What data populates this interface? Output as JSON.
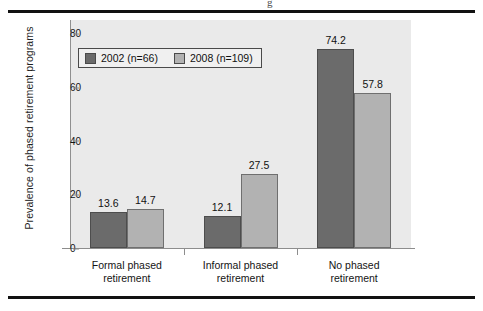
{
  "page": {
    "cut_glyph": "g"
  },
  "chart_data": {
    "type": "bar",
    "title": "",
    "xlabel": "",
    "ylabel": "Prevalence of phased retirement programs",
    "ylim": [
      0,
      85
    ],
    "yticks": [
      "0",
      "20",
      "40",
      "60",
      "80"
    ],
    "grid": false,
    "legend_position": "top-left",
    "categories": [
      "Formal phased\nretirement",
      "Informal phased\nretirement",
      "No phased\nretirement"
    ],
    "category_lines": [
      [
        "Formal phased",
        "retirement"
      ],
      [
        "Informal phased",
        "retirement"
      ],
      [
        "No phased",
        "retirement"
      ]
    ],
    "series": [
      {
        "name": "2002 (n=66)",
        "color": "#6b6b6b",
        "values": [
          13.6,
          14.7,
          0
        ],
        "value_labels": [
          "13.6",
          "12.1",
          "74.2"
        ],
        "data": [
          13.6,
          12.1,
          74.2
        ]
      },
      {
        "name": "2008 (n=109)",
        "color": "#b2b2b2",
        "values": [
          14.7,
          27.5,
          57.8
        ],
        "value_labels": [
          "14.7",
          "27.5",
          "57.8"
        ],
        "data": [
          14.7,
          27.5,
          57.8
        ]
      }
    ]
  },
  "legend": {
    "items": [
      {
        "label": "2002 (n=66)",
        "swatch": "dark-gray-swatch"
      },
      {
        "label": "2008 (n=109)",
        "swatch": "light-gray-swatch"
      }
    ]
  },
  "axes": {
    "y_title": "Prevalence of phased retirement programs",
    "y_ticks": [
      "80",
      "60",
      "40",
      "20",
      "0"
    ]
  }
}
